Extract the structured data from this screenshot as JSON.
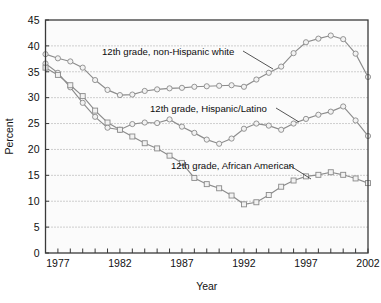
{
  "chart_data": {
    "type": "line",
    "title": "",
    "xlabel": "Year",
    "ylabel": "Percent",
    "xlim": [
      1976,
      2002
    ],
    "ylim": [
      0,
      45
    ],
    "ytick_values": [
      0,
      5,
      10,
      15,
      20,
      25,
      30,
      35,
      40,
      45
    ],
    "ytick_labels": [
      "0",
      "5",
      "10",
      "15",
      "20",
      "25",
      "30",
      "35",
      "40",
      "45"
    ],
    "xtick_values": [
      1977,
      1982,
      1987,
      1992,
      1997,
      2002
    ],
    "xtick_labels": [
      "1977",
      "1982",
      "1987",
      "1992",
      "1997",
      "2002"
    ],
    "xminor_step": 1,
    "grid": "horizontal-dotted",
    "legend_position": "inline-annotations",
    "x": [
      1976,
      1977,
      1978,
      1979,
      1980,
      1981,
      1982,
      1983,
      1984,
      1985,
      1986,
      1987,
      1988,
      1989,
      1990,
      1991,
      1992,
      1993,
      1994,
      1995,
      1996,
      1997,
      1998,
      1999,
      2000,
      2001,
      2002
    ],
    "series": [
      {
        "name": "12th grade, non-Hispanic white",
        "marker": "circle",
        "values": [
          38.4,
          37.6,
          37.0,
          35.8,
          33.4,
          31.5,
          30.5,
          30.6,
          31.3,
          31.6,
          31.8,
          31.9,
          32.1,
          32.2,
          32.3,
          32.4,
          32.1,
          33.5,
          34.8,
          36.0,
          38.6,
          40.7,
          41.4,
          42.0,
          41.3,
          38.5,
          34.0
        ]
      },
      {
        "name": "12th grade, Hispanic/Latino",
        "marker": "circle",
        "values": [
          36.6,
          34.8,
          32.0,
          29.0,
          26.3,
          24.2,
          23.8,
          24.9,
          25.2,
          25.1,
          25.8,
          24.4,
          23.2,
          21.9,
          21.1,
          22.1,
          24.0,
          25.0,
          24.6,
          23.8,
          25.0,
          25.9,
          26.7,
          27.3,
          28.3,
          25.6,
          22.6
        ]
      },
      {
        "name": "12th grade, African American",
        "marker": "square",
        "values": [
          35.8,
          34.4,
          32.4,
          30.3,
          27.5,
          25.2,
          23.8,
          22.5,
          21.2,
          20.2,
          18.8,
          17.4,
          14.5,
          13.3,
          12.5,
          11.1,
          9.4,
          9.8,
          11.2,
          12.8,
          14.0,
          14.8,
          15.1,
          15.6,
          15.1,
          14.4,
          13.5
        ]
      }
    ],
    "annotations": [
      {
        "text": "12th grade, non-Hispanic white",
        "text_x": 102,
        "text_y": 55,
        "leader": [
          [
            243,
            51
          ],
          [
            273,
            69
          ]
        ]
      },
      {
        "text": "12th grade, Hispanic/Latino",
        "text_x": 150,
        "text_y": 112,
        "leader": [
          [
            276,
            108
          ],
          [
            299,
            122
          ]
        ]
      },
      {
        "text": "12th grade, African American",
        "text_x": 171,
        "text_y": 169,
        "leader": [
          [
            289,
            165
          ],
          [
            311,
            179
          ]
        ]
      }
    ]
  },
  "colors": {
    "series_line": "#8c8c8c",
    "marker_fill": "#f2f2f2",
    "marker_stroke": "#8a8a8a",
    "axis": "#3a3a3a",
    "grid": "#8a8a8a",
    "text": "#111111",
    "plot_background": "#fbfbfb"
  }
}
